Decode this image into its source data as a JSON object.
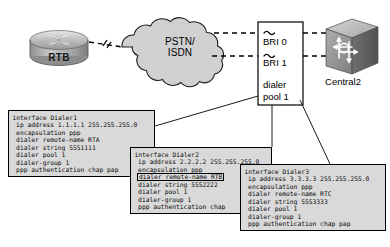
{
  "diagram": {
    "devices": {
      "rtb": {
        "label": "RTB",
        "icon": "router-icon"
      },
      "cloud": {
        "line1": "PSTN/",
        "line2": "ISDN",
        "icon": "cloud-icon"
      },
      "central": {
        "label": "Central2",
        "icon": "switch-icon"
      }
    },
    "callout": {
      "bri0": "BRI 0",
      "bri1": "BRI 1",
      "dialer_line1": "dialer",
      "dialer_line2": "pool 1"
    },
    "colors": {
      "cloud_fill": "#d0d0d0",
      "box_fill": "#d9d9d9",
      "stroke": "#000000",
      "device_fill": "#b0b0b0"
    }
  },
  "configs": [
    {
      "name": "dialer1-config",
      "lines": [
        {
          "text": "interface Dialer1",
          "indent": false,
          "highlight": false
        },
        {
          "text": "ip address 1.1.1.1 255.255.255.0",
          "indent": true,
          "highlight": false
        },
        {
          "text": "encapsulation ppp",
          "indent": true,
          "highlight": false
        },
        {
          "text": "dialer remote-name RTA",
          "indent": true,
          "highlight": false
        },
        {
          "text": "dialer string 5551111",
          "indent": true,
          "highlight": false
        },
        {
          "text": "dialer pool 1",
          "indent": true,
          "highlight": false
        },
        {
          "text": "dialer-group 1",
          "indent": true,
          "highlight": false
        },
        {
          "text": "ppp authentication chap pap",
          "indent": true,
          "highlight": false
        }
      ]
    },
    {
      "name": "dialer2-config",
      "lines": [
        {
          "text": "interface Dialer2",
          "indent": false,
          "highlight": false
        },
        {
          "text": "ip address 2.2.2.2 255.255.255.0",
          "indent": true,
          "highlight": false
        },
        {
          "text": "encapsulation ppp",
          "indent": true,
          "highlight": false
        },
        {
          "text": "dialer remote-name RTB",
          "indent": false,
          "highlight": true
        },
        {
          "text": "dialer string 5552222",
          "indent": true,
          "highlight": false
        },
        {
          "text": "dialer pool 1",
          "indent": true,
          "highlight": false
        },
        {
          "text": "dialer-group 1",
          "indent": true,
          "highlight": false
        },
        {
          "text": "ppp authentication chap",
          "indent": true,
          "highlight": false
        }
      ]
    },
    {
      "name": "dialer3-config",
      "lines": [
        {
          "text": "interface Dialer3",
          "indent": false,
          "highlight": false
        },
        {
          "text": "ip address 3.3.3.3 255.255.255.0",
          "indent": true,
          "highlight": false
        },
        {
          "text": "encapsulation ppp",
          "indent": true,
          "highlight": false
        },
        {
          "text": "dialer remote-name RTC",
          "indent": true,
          "highlight": false
        },
        {
          "text": "dialer string 5553333",
          "indent": true,
          "highlight": false
        },
        {
          "text": "dialer pool 1",
          "indent": true,
          "highlight": false
        },
        {
          "text": "dialer-group 1",
          "indent": true,
          "highlight": false
        },
        {
          "text": "ppp authentication chap pap",
          "indent": true,
          "highlight": false
        }
      ]
    }
  ]
}
